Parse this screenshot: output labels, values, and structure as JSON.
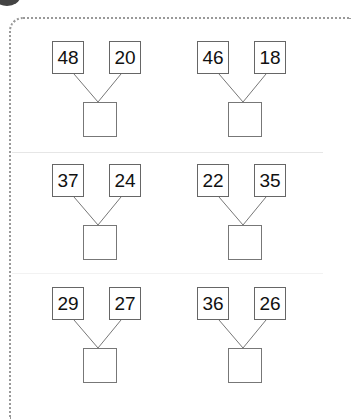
{
  "worksheet": {
    "section_badge": "dark-circle",
    "problems": [
      {
        "left": "48",
        "right": "20",
        "answer": ""
      },
      {
        "left": "46",
        "right": "18",
        "answer": ""
      },
      {
        "left": "37",
        "right": "24",
        "answer": ""
      },
      {
        "left": "22",
        "right": "35",
        "answer": ""
      },
      {
        "left": "29",
        "right": "27",
        "answer": ""
      },
      {
        "left": "36",
        "right": "26",
        "answer": ""
      }
    ]
  }
}
